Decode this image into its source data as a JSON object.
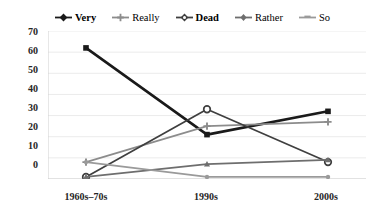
{
  "chart_data": {
    "type": "line",
    "title": "",
    "xlabel": "",
    "ylabel": "",
    "categories": [
      "1960s–70s",
      "1990s",
      "2000s"
    ],
    "ylim": [
      0,
      70
    ],
    "yticks": [
      0,
      10,
      20,
      30,
      40,
      50,
      60,
      70
    ],
    "grid": true,
    "legend_position": "top",
    "series": [
      {
        "name": "Very",
        "color": "#1a1a1a",
        "marker": "square",
        "values": [
          62,
          21,
          32
        ]
      },
      {
        "name": "Really",
        "color": "#8c8c8c",
        "marker": "cross",
        "values": [
          8,
          25,
          27
        ]
      },
      {
        "name": "Dead",
        "color": "#3f3f3f",
        "marker": "circle-open",
        "values": [
          1,
          33,
          8
        ]
      },
      {
        "name": "Rather",
        "color": "#6e6e6e",
        "marker": "triangle",
        "values": [
          1,
          7,
          9
        ]
      },
      {
        "name": "So",
        "color": "#9a9a9a",
        "marker": "dash",
        "values": [
          8,
          1,
          1
        ]
      }
    ]
  },
  "legend": {
    "items": [
      {
        "label": "Very",
        "bold": true,
        "color": "#1a1a1a"
      },
      {
        "label": "Really",
        "bold": false,
        "color": "#8c8c8c"
      },
      {
        "label": "Dead",
        "bold": true,
        "color": "#3f3f3f"
      },
      {
        "label": "Rather",
        "bold": false,
        "color": "#6e6e6e"
      },
      {
        "label": "So",
        "bold": false,
        "color": "#9a9a9a"
      }
    ]
  },
  "axes": {
    "y_tick_labels": [
      "70",
      "60",
      "50",
      "40",
      "30",
      "20",
      "10",
      "0"
    ],
    "x_tick_labels": [
      "1960s–70s",
      "1990s",
      "2000s"
    ]
  },
  "colors": {
    "grid": "#ebebeb",
    "axis": "#cfcfcf",
    "text": "#262626",
    "background": "#ffffff"
  }
}
